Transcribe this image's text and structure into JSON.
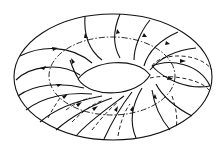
{
  "figure": {
    "stroke_color": "#111111",
    "background": "#ffffff",
    "elements": {
      "outer_boundary": "solid ellipse",
      "inner_hole": "lens-shaped hole",
      "core_circle": "dash-dot ellipse",
      "meridian_cross_section": "solid and dashed ellipse on right side",
      "flow_lines": "curved solid lines with arrowheads winding around torus",
      "hidden_lines": "dashed lines on lower back surface"
    }
  }
}
